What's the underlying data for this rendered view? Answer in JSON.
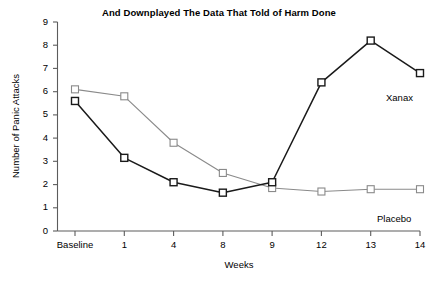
{
  "chart_data": {
    "type": "line",
    "title": "And Downplayed The Data That Told of Harm Done",
    "xlabel": "Weeks",
    "ylabel": "Number of Panic Attacks",
    "categories": [
      "Baseline",
      "1",
      "4",
      "8",
      "9",
      "12",
      "13",
      "14"
    ],
    "ylim": [
      0,
      9
    ],
    "yticks": [
      "0",
      "1",
      "2",
      "3",
      "4",
      "5",
      "6",
      "7",
      "8",
      "9"
    ],
    "grid": false,
    "legend_position": "inline-right-endpoint",
    "series": [
      {
        "name": "Xanax",
        "color": "#1a1a1a",
        "marker": "open-square",
        "values": [
          5.6,
          3.15,
          2.1,
          1.65,
          2.1,
          6.4,
          8.2,
          6.8
        ]
      },
      {
        "name": "Placebo",
        "color": "#8a8a8a",
        "marker": "open-square",
        "values": [
          6.1,
          5.8,
          3.8,
          2.5,
          1.85,
          1.7,
          1.8,
          1.8
        ]
      }
    ],
    "annotations": [
      {
        "text": "Xanax",
        "series": "Xanax",
        "at_category": "14"
      },
      {
        "text": "Placebo",
        "series": "Placebo",
        "at_category": "14"
      }
    ]
  }
}
